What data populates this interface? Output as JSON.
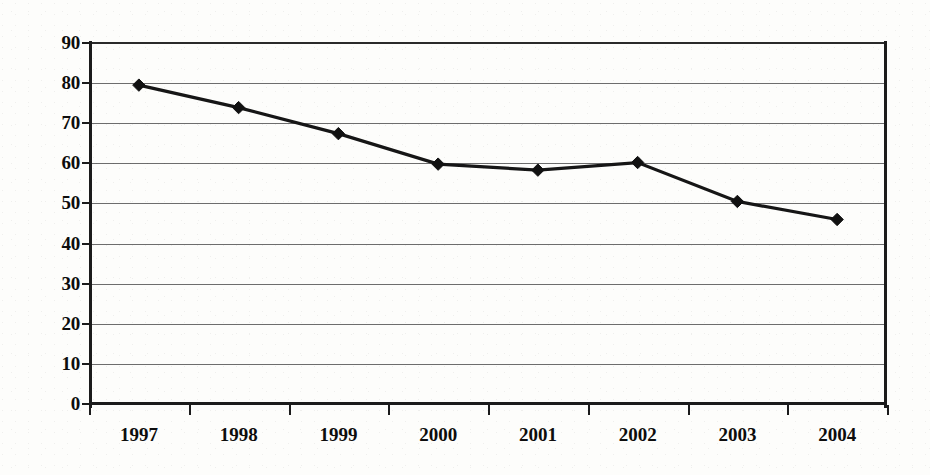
{
  "chart_data": {
    "type": "line",
    "title": "",
    "subtitle": "",
    "xlabel": "",
    "ylabel": "",
    "categories": [
      "1997",
      "1998",
      "1999",
      "2000",
      "2001",
      "2002",
      "2003",
      "2004"
    ],
    "values": [
      79.5,
      73.9,
      67.4,
      59.8,
      58.3,
      60.2,
      50.5,
      46.0
    ],
    "series": [
      {
        "name": "",
        "values": [
          79.5,
          73.9,
          67.4,
          59.8,
          58.3,
          60.2,
          50.5,
          46.0
        ]
      }
    ],
    "ylim": [
      0,
      90
    ],
    "yticks": [
      0,
      10,
      20,
      30,
      40,
      50,
      60,
      70,
      80,
      90
    ],
    "ytick_labels": [
      "0",
      "10",
      "20",
      "30",
      "40",
      "50",
      "60",
      "70",
      "80",
      "90"
    ],
    "grid": true,
    "grid_axis": "y",
    "legend": false,
    "legend_position": "none",
    "marker": "diamond",
    "annotations": []
  },
  "style": {
    "background": "#fdfdfb",
    "line_color": "#161616",
    "marker_color": "#111111",
    "grid_color": "#6d6d6d",
    "axis_color": "#1b1b1b",
    "label_color": "#0d0d0d"
  }
}
